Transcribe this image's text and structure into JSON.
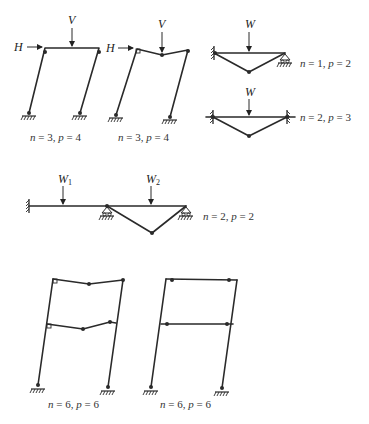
{
  "diagrams": {
    "sway_frame": {
      "load_h": "H",
      "load_v": "V",
      "label_n": "n",
      "label_n_val": " = 3, ",
      "label_p": "p",
      "label_p_val": " = 4"
    },
    "combined_frame": {
      "load_h": "H",
      "load_v": "V",
      "label_n": "n",
      "label_n_val": " = 3, ",
      "label_p": "p",
      "label_p_val": " = 4"
    },
    "propped_beam": {
      "load": "W",
      "label_n": "n",
      "label_n_val": " = 1, ",
      "label_p": "p",
      "label_p_val": " = 2"
    },
    "fixed_beam": {
      "load": "W",
      "label_n": "n",
      "label_n_val": " = 2, ",
      "label_p": "p",
      "label_p_val": " = 3"
    },
    "continuous_beam": {
      "load_1": "W",
      "load_1_sub": "1",
      "load_2": "W",
      "load_2_sub": "2",
      "label_n": "n",
      "label_n_val": " = 2, ",
      "label_p": "p",
      "label_p_val": " = 2"
    },
    "two_storey_beam_mech": {
      "label_n": "n",
      "label_n_val": " = 6, ",
      "label_p": "p",
      "label_p_val": " = 6"
    },
    "two_storey_sway": {
      "label_n": "n",
      "label_n_val": " = 6, ",
      "label_p": "p",
      "label_p_val": " = 6"
    }
  }
}
